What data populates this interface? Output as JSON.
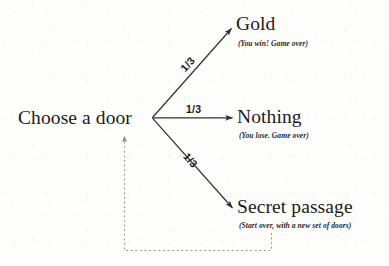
{
  "diagram": {
    "type": "probability-tree",
    "root": {
      "label": "Choose a door"
    },
    "branches": [
      {
        "id": "gold",
        "probability": "1/3",
        "label": "Gold",
        "subtitle": "(You win! Game over)",
        "direction": "up"
      },
      {
        "id": "nothing",
        "probability": "1/3",
        "label": "Nothing",
        "subtitle": "(You lose. Game over)",
        "direction": "straight"
      },
      {
        "id": "secret-passage",
        "probability": "1/3",
        "label": "Secret passage",
        "subtitle": "(Start over, with a new set of doors)",
        "direction": "down"
      }
    ],
    "feedback_loop": {
      "from": "secret-passage",
      "to": "root",
      "style": "dotted"
    },
    "colors": {
      "background": "#fdfdfb",
      "ink": "#1b1b1b",
      "stroke": "#3a3a3a",
      "dotted_stroke": "#9a9a96"
    }
  }
}
